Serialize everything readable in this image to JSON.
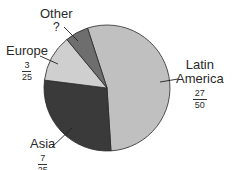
{
  "chart_data": {
    "type": "pie",
    "title": "",
    "start_angle_deg_from_top": -18,
    "direction": "clockwise",
    "slices": [
      {
        "name": "Latin America",
        "fraction_label": "27/50",
        "num": "27",
        "den": "50",
        "value": 0.54,
        "color": "#c0c0c0"
      },
      {
        "name": "Asia",
        "fraction_label": "7/25",
        "num": "7",
        "den": "25",
        "value": 0.28,
        "color": "#3a3a3a"
      },
      {
        "name": "Europe",
        "fraction_label": "3/25",
        "num": "3",
        "den": "25",
        "value": 0.12,
        "color": "#cfcfcf"
      },
      {
        "name": "Other",
        "fraction_label": "?",
        "num": "?",
        "den": "",
        "value": 0.06,
        "color": "#6e6e6e"
      }
    ]
  },
  "labels": {
    "latin_america": {
      "line1": "Latin",
      "line2": "America",
      "num": "27",
      "den": "50"
    },
    "asia": {
      "name": "Asia",
      "num": "7",
      "den": "25"
    },
    "europe": {
      "name": "Europe",
      "num": "3",
      "den": "25"
    },
    "other": {
      "name": "Other",
      "value": "?"
    }
  }
}
